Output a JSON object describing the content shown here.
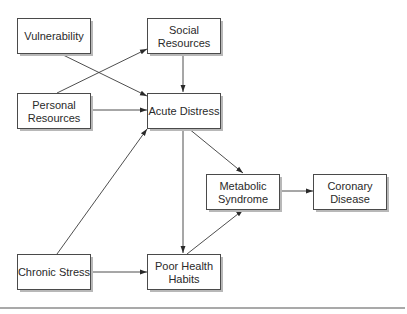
{
  "diagram": {
    "type": "path-model",
    "nodes": [
      {
        "id": "vulnerability",
        "lines": [
          "Vulnerability"
        ]
      },
      {
        "id": "social_resources",
        "lines": [
          "Social",
          "Resources"
        ]
      },
      {
        "id": "personal_resources",
        "lines": [
          "Personal",
          "Resources"
        ]
      },
      {
        "id": "acute_distress",
        "lines": [
          "Acute Distress"
        ]
      },
      {
        "id": "metabolic_syndrome",
        "lines": [
          "Metabolic",
          "Syndrome"
        ]
      },
      {
        "id": "coronary_disease",
        "lines": [
          "Coronary",
          "Disease"
        ]
      },
      {
        "id": "chronic_stress",
        "lines": [
          "Chronic Stress"
        ]
      },
      {
        "id": "poor_health_habits",
        "lines": [
          "Poor Health",
          "Habits"
        ]
      }
    ],
    "edges": [
      {
        "from": "vulnerability",
        "to": "acute_distress"
      },
      {
        "from": "personal_resources",
        "to": "social_resources"
      },
      {
        "from": "social_resources",
        "to": "acute_distress"
      },
      {
        "from": "personal_resources",
        "to": "acute_distress"
      },
      {
        "from": "chronic_stress",
        "to": "acute_distress"
      },
      {
        "from": "acute_distress",
        "to": "metabolic_syndrome"
      },
      {
        "from": "acute_distress",
        "to": "poor_health_habits"
      },
      {
        "from": "chronic_stress",
        "to": "poor_health_habits"
      },
      {
        "from": "poor_health_habits",
        "to": "metabolic_syndrome"
      },
      {
        "from": "metabolic_syndrome",
        "to": "coronary_disease"
      }
    ]
  }
}
